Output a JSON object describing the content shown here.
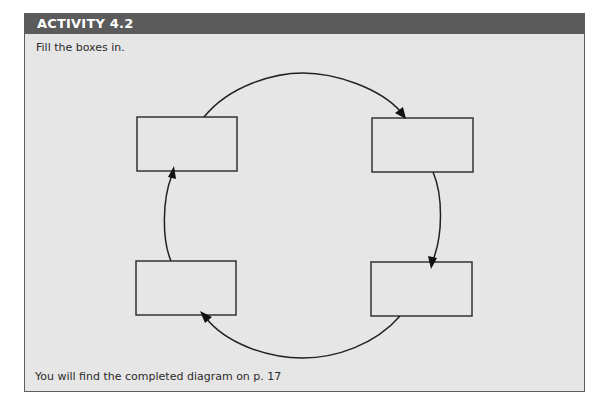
{
  "activity": {
    "title": "ACTIVITY 4.2",
    "instruction": "Fill the boxes in.",
    "footer_note": "You will find the completed diagram on p. 17"
  },
  "diagram": {
    "type": "cycle",
    "boxes": [
      {
        "id": "top-left",
        "label": ""
      },
      {
        "id": "top-right",
        "label": ""
      },
      {
        "id": "bottom-right",
        "label": ""
      },
      {
        "id": "bottom-left",
        "label": ""
      }
    ],
    "flow": [
      "top-left",
      "top-right",
      "bottom-right",
      "bottom-left",
      "top-left"
    ],
    "direction": "clockwise"
  },
  "colors": {
    "header_bg": "#5b5b5b",
    "header_text": "#ffffff",
    "panel_bg": "#e6e6e6",
    "stroke": "#222222"
  }
}
